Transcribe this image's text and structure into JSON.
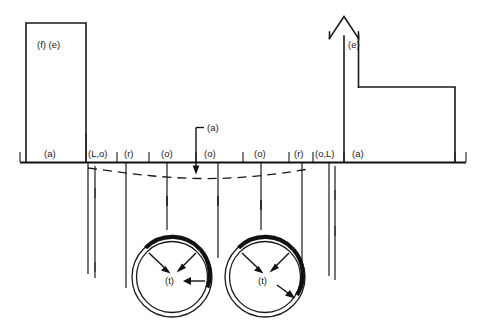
{
  "figure": {
    "background_color": "#ffffff",
    "line_color": "#1a1a1a",
    "width": 477,
    "height": 324
  },
  "structures": {
    "left_building": {
      "label": "(f) (e)",
      "name": "left-building"
    },
    "right_building": {
      "label": "(e)",
      "name": "right-building-spire"
    }
  },
  "annotations": {
    "settlement_trough": {
      "label": "(a)",
      "name": "settlement-trough-callout"
    }
  },
  "ground_surface_labels": [
    {
      "text": "(a)"
    },
    {
      "text": "(L,o)"
    },
    {
      "text": "(r)"
    },
    {
      "text": "(o)"
    },
    {
      "text": "(o)"
    },
    {
      "text": "(o)"
    },
    {
      "text": "(r)"
    },
    {
      "text": "(o,L)"
    },
    {
      "text": "(a)"
    }
  ],
  "tunnels": [
    {
      "label": "(t)",
      "name": "tunnel-left"
    },
    {
      "label": "(t)",
      "name": "tunnel-right"
    }
  ]
}
